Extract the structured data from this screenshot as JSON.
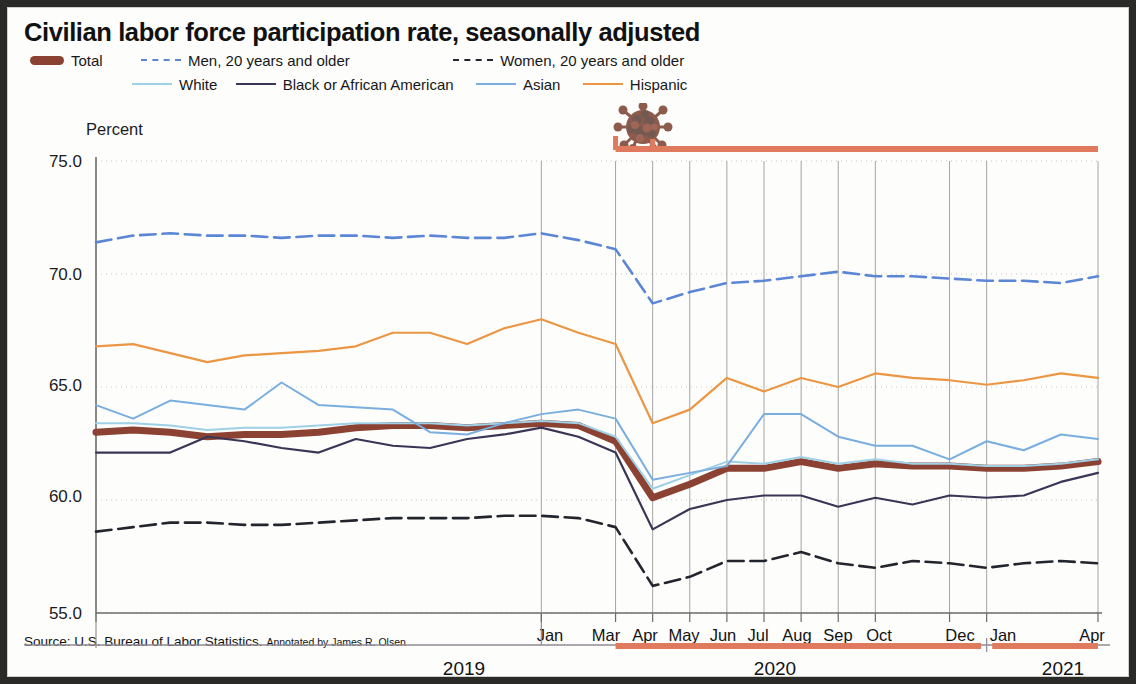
{
  "title": "Civilian labor force participation rate, seasonally adjusted",
  "source": {
    "main": "Source: U.S. Bureau of Labor Statistics.",
    "annotation": "Annotated by James R. Olsen"
  },
  "legend": {
    "row1": [
      {
        "label": "Total",
        "style": "thick",
        "color": "#8c4233",
        "icon": "legend-swatch-total"
      },
      {
        "label": "Men, 20 years and older",
        "style": "dashed",
        "color": "#5b86d6",
        "icon": "legend-swatch-men"
      },
      {
        "label": "Women, 20 years and older",
        "style": "dashed",
        "color": "#23252e",
        "icon": "legend-swatch-women"
      }
    ],
    "row2": [
      {
        "label": "White",
        "style": "solid",
        "color": "#9ed0e6",
        "icon": "legend-swatch-white"
      },
      {
        "label": "Black or African American",
        "style": "solid",
        "color": "#3b3555",
        "icon": "legend-swatch-black"
      },
      {
        "label": "Asian",
        "style": "solid",
        "color": "#7aaede",
        "icon": "legend-swatch-asian"
      },
      {
        "label": "Hispanic",
        "style": "solid",
        "color": "#eb9644",
        "icon": "legend-swatch-hispanic"
      }
    ]
  },
  "axis": {
    "ylabel": "Percent",
    "yticks": [
      "75.0",
      "70.0",
      "65.0",
      "60.0",
      "55.0"
    ],
    "xticks": [
      "Jan",
      "Mar",
      "Apr",
      "May",
      "Jun",
      "Jul",
      "Aug",
      "Sep",
      "Oct",
      "Dec",
      "Jan",
      "Apr"
    ],
    "years": [
      "2019",
      "2020",
      "2021"
    ]
  },
  "annotation": {
    "icon": "coronavirus-icon",
    "bar_color": "#e07a5f",
    "bar_label": "covid-period-bar"
  },
  "chart_data": {
    "type": "line",
    "title": "Civilian labor force participation rate, seasonally adjusted",
    "xlabel": "",
    "ylabel": "Percent",
    "ylim": [
      55.0,
      75.0
    ],
    "yticks": [
      55.0,
      60.0,
      65.0,
      70.0,
      75.0
    ],
    "grid": true,
    "legend_position": "top",
    "x": [
      "2019-01",
      "2019-02",
      "2019-03",
      "2019-04",
      "2019-05",
      "2019-06",
      "2019-07",
      "2019-08",
      "2019-09",
      "2019-10",
      "2019-11",
      "2019-12",
      "2020-01",
      "2020-02",
      "2020-03",
      "2020-04",
      "2020-05",
      "2020-06",
      "2020-07",
      "2020-08",
      "2020-09",
      "2020-10",
      "2020-11",
      "2020-12",
      "2021-01",
      "2021-02",
      "2021-03",
      "2021-04"
    ],
    "x_tick_labels": {
      "2019-01": "Jan",
      "2020-03": "Mar",
      "2020-04": "Apr",
      "2020-05": "May",
      "2020-06": "Jun",
      "2020-07": "Jul",
      "2020-08": "Aug",
      "2020-09": "Sep",
      "2020-10": "Oct",
      "2020-12": "Dec",
      "2021-01": "Jan",
      "2021-04": "Apr"
    },
    "series": [
      {
        "name": "Total",
        "color": "#8c4233",
        "style": "thick-solid",
        "width": 7,
        "values": [
          63.0,
          63.1,
          63.0,
          62.8,
          62.9,
          62.9,
          63.0,
          63.2,
          63.3,
          63.3,
          63.2,
          63.3,
          63.4,
          63.3,
          62.6,
          60.1,
          60.7,
          61.4,
          61.4,
          61.7,
          61.4,
          61.6,
          61.5,
          61.5,
          61.4,
          61.4,
          61.5,
          61.7
        ]
      },
      {
        "name": "Men, 20 years and older",
        "color": "#5b86d6",
        "style": "dashed",
        "width": 2.6,
        "values": [
          71.4,
          71.7,
          71.8,
          71.7,
          71.7,
          71.6,
          71.7,
          71.7,
          71.6,
          71.7,
          71.6,
          71.6,
          71.8,
          71.5,
          71.1,
          68.7,
          69.2,
          69.6,
          69.7,
          69.9,
          70.1,
          69.9,
          69.9,
          69.8,
          69.7,
          69.7,
          69.6,
          69.9
        ]
      },
      {
        "name": "Women, 20 years and older",
        "color": "#23252e",
        "style": "dashed",
        "width": 2.6,
        "values": [
          58.6,
          58.8,
          59.0,
          59.0,
          58.9,
          58.9,
          59.0,
          59.1,
          59.2,
          59.2,
          59.2,
          59.3,
          59.3,
          59.2,
          58.8,
          56.2,
          56.6,
          57.3,
          57.3,
          57.7,
          57.2,
          57.0,
          57.3,
          57.2,
          57.0,
          57.2,
          57.3,
          57.2
        ]
      },
      {
        "name": "White",
        "color": "#9ed0e6",
        "style": "solid",
        "width": 2.0,
        "values": [
          63.4,
          63.4,
          63.3,
          63.1,
          63.2,
          63.2,
          63.3,
          63.4,
          63.4,
          63.4,
          63.3,
          63.4,
          63.5,
          63.4,
          62.8,
          60.5,
          61.1,
          61.7,
          61.6,
          61.9,
          61.6,
          61.8,
          61.6,
          61.6,
          61.5,
          61.5,
          61.6,
          61.8
        ]
      },
      {
        "name": "Black or African American",
        "color": "#3b3555",
        "style": "solid",
        "width": 2.2,
        "values": [
          62.1,
          62.1,
          62.1,
          62.8,
          62.6,
          62.3,
          62.1,
          62.7,
          62.4,
          62.3,
          62.7,
          62.9,
          63.2,
          62.8,
          62.1,
          58.7,
          59.6,
          60.0,
          60.2,
          60.2,
          59.7,
          60.1,
          59.8,
          60.2,
          60.1,
          60.2,
          60.8,
          61.2
        ]
      },
      {
        "name": "Asian",
        "color": "#7aaede",
        "style": "solid",
        "width": 2.0,
        "values": [
          64.2,
          63.6,
          64.4,
          64.2,
          64.0,
          65.2,
          64.2,
          64.1,
          64.0,
          63.0,
          62.9,
          63.4,
          63.8,
          64.0,
          63.6,
          60.9,
          61.2,
          61.5,
          63.8,
          63.8,
          62.8,
          62.4,
          62.4,
          61.8,
          62.6,
          62.2,
          62.9,
          62.7
        ]
      },
      {
        "name": "Hispanic",
        "color": "#eb9644",
        "style": "solid",
        "width": 2.2,
        "values": [
          66.8,
          66.9,
          66.5,
          66.1,
          66.4,
          66.5,
          66.6,
          66.8,
          67.4,
          67.4,
          66.9,
          67.6,
          68.0,
          67.4,
          66.9,
          63.4,
          64.0,
          65.4,
          64.8,
          65.4,
          65.0,
          65.6,
          65.4,
          65.3,
          65.1,
          65.3,
          65.6,
          65.4
        ]
      }
    ]
  }
}
